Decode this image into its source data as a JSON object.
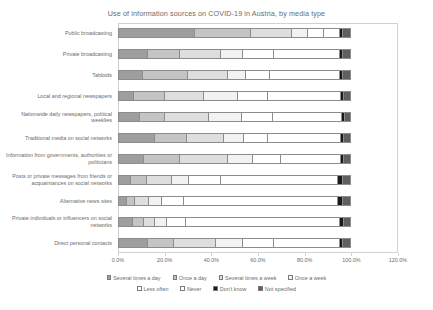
{
  "chart_data": {
    "type": "bar",
    "orientation": "horizontal",
    "stacked": true,
    "title": "Use of information sources on COVID-19 in Austria, by media type",
    "xlabel": "",
    "ylabel": "",
    "xlim": [
      0,
      120
    ],
    "xticks": [
      "0.0%",
      "20.0%",
      "40.0%",
      "60.0%",
      "80.0%",
      "100.0%",
      "120.0%"
    ],
    "xtick_values": [
      0,
      20,
      40,
      60,
      80,
      100,
      120
    ],
    "grid": false,
    "legend_position": "bottom",
    "categories": [
      "Public broadcasting",
      "Private broadcasting",
      "Tabloids",
      "Local and regional newspapers",
      "Nationwide daily newspapers, political weeklies",
      "Traditional media on social networks",
      "Information from governments, authorities or politicians",
      "Posts or private messages from friends or acquaintances on social networks",
      "Alternative news sites",
      "Private individuals or influencers on social networks",
      "Direct personal contacts"
    ],
    "series": [
      {
        "name": "Several times a day",
        "color": "#9e9e9e",
        "values": [
          33.0,
          13.0,
          10.5,
          7.0,
          9.5,
          16.0,
          11.0,
          5.5,
          4.0,
          6.5,
          13.0
        ]
      },
      {
        "name": "Once a day",
        "color": "#c4c4c4",
        "values": [
          24.0,
          13.5,
          19.5,
          13.0,
          10.5,
          13.5,
          15.5,
          7.0,
          3.5,
          4.5,
          11.0
        ]
      },
      {
        "name": "Several times a week",
        "color": "#dedede",
        "values": [
          17.5,
          17.5,
          17.0,
          17.0,
          19.0,
          16.0,
          20.5,
          10.5,
          6.0,
          5.0,
          18.0
        ]
      },
      {
        "name": "Once a week",
        "color": "#f2f2f2",
        "values": [
          7.0,
          9.5,
          8.0,
          14.5,
          14.0,
          8.5,
          11.0,
          7.5,
          5.5,
          5.0,
          11.5
        ]
      },
      {
        "name": "Less often",
        "color": "#ffffff",
        "values": [
          7.0,
          13.5,
          10.0,
          13.0,
          13.5,
          10.5,
          12.0,
          13.5,
          9.5,
          8.0,
          13.5
        ]
      },
      {
        "name": "Never",
        "color": "#ffffff",
        "values": [
          6.5,
          28.0,
          30.0,
          31.0,
          29.5,
          31.0,
          25.5,
          50.5,
          66.0,
          66.0,
          28.0
        ]
      },
      {
        "name": "Don't know",
        "color": "#1a1a1a",
        "values": [
          1.5,
          1.5,
          1.5,
          1.5,
          1.5,
          1.5,
          1.5,
          2.0,
          2.0,
          2.0,
          1.5
        ]
      },
      {
        "name": "Not specified",
        "color": "#5f5f5f",
        "values": [
          3.5,
          3.5,
          3.5,
          3.0,
          2.5,
          3.0,
          3.0,
          3.5,
          3.5,
          3.0,
          3.5
        ]
      }
    ]
  },
  "legend": {
    "items": [
      {
        "label": "Several times a day",
        "swatch": "s0"
      },
      {
        "label": "Once a day",
        "swatch": "s1"
      },
      {
        "label": "Several times a week",
        "swatch": "s2"
      },
      {
        "label": "Once a week",
        "swatch": "s3"
      },
      {
        "label": "Less often",
        "swatch": "s4"
      },
      {
        "label": "Never",
        "swatch": "s5"
      },
      {
        "label": "Don't know",
        "swatch": "s6"
      },
      {
        "label": "Not specified",
        "swatch": "s7"
      }
    ]
  }
}
